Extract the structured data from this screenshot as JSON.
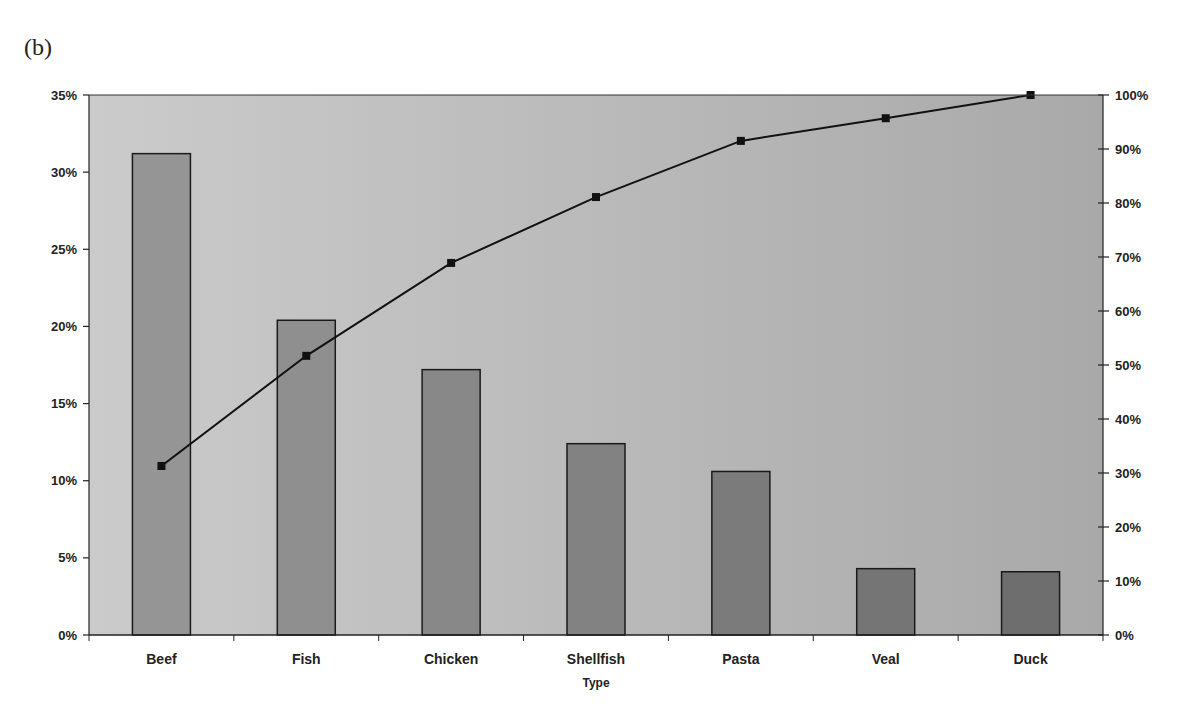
{
  "figure": {
    "panel_label": "(b)"
  },
  "colors": {
    "plot_bg_left": "#cbcbcb",
    "plot_bg_right": "#a9a9a9",
    "bar_fill_light": "#959595",
    "bar_fill_dark": "#6e6e6e",
    "bar_stroke": "#1a1a1a",
    "line": "#111111",
    "marker": "#111111",
    "axis": "#222222"
  },
  "chart_data": {
    "type": "bar+line (pareto)",
    "title": "",
    "xlabel": "Type",
    "ylabel_left": "",
    "ylabel_right": "",
    "categories": [
      "Beef",
      "Fish",
      "Chicken",
      "Shellfish",
      "Pasta",
      "Veal",
      "Duck"
    ],
    "series": [
      {
        "name": "Share",
        "type": "bar",
        "axis": "left",
        "values": [
          31.2,
          20.4,
          17.2,
          12.4,
          10.6,
          4.3,
          4.1
        ]
      },
      {
        "name": "Cumulative share",
        "type": "line",
        "axis": "right",
        "marker": "square",
        "values": [
          31.3,
          51.7,
          68.9,
          81.1,
          91.5,
          95.7,
          100
        ]
      }
    ],
    "y_left": {
      "ylim": [
        0,
        35
      ],
      "ticks": [
        0,
        5,
        10,
        15,
        20,
        25,
        30,
        35
      ],
      "tick_labels": [
        "0%",
        "5%",
        "10%",
        "15%",
        "20%",
        "25%",
        "30%",
        "35%"
      ]
    },
    "y_right": {
      "ylim": [
        0,
        100
      ],
      "ticks": [
        0,
        10,
        20,
        30,
        40,
        50,
        60,
        70,
        80,
        90,
        100
      ],
      "tick_labels": [
        "0%",
        "10%",
        "20%",
        "30%",
        "40%",
        "50%",
        "60%",
        "70%",
        "80%",
        "90%",
        "100%"
      ]
    },
    "grid": false,
    "legend": null
  }
}
